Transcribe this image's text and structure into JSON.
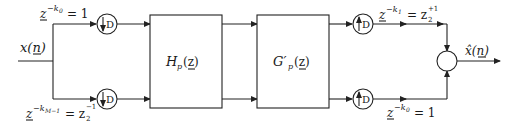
{
  "diagram": {
    "input_label": "x(n)",
    "output_label": "x̂(n)",
    "blocks": {
      "analysis": {
        "label": "H",
        "sub": "p",
        "arg": "(z)"
      },
      "synthesis": {
        "label": "G′",
        "sub": "p",
        "arg": "(z)"
      }
    },
    "downsamplers": [
      {
        "symbol": "D",
        "direction": "down"
      },
      {
        "symbol": "D",
        "direction": "down"
      }
    ],
    "upsamplers": [
      {
        "symbol": "D",
        "direction": "up"
      },
      {
        "symbol": "D",
        "direction": "up"
      }
    ],
    "delay_labels": {
      "top_left": {
        "base": "z",
        "exp": "−k",
        "exp_sub": "0",
        "rhs": "= 1"
      },
      "bottom_left": {
        "base": "z",
        "exp": "−k",
        "exp_sub": "M−1",
        "rhs": "= z",
        "rhs_sub": "2",
        "rhs_exp": "−1"
      },
      "top_right": {
        "base": "z",
        "exp": "−k",
        "exp_sub": "1",
        "rhs": "= z",
        "rhs_sub": "2",
        "rhs_exp": "+1"
      },
      "bottom_right": {
        "base": "z",
        "exp": "−k",
        "exp_sub": "0",
        "rhs": "= 1"
      }
    },
    "summer": {
      "symbol": ""
    }
  }
}
